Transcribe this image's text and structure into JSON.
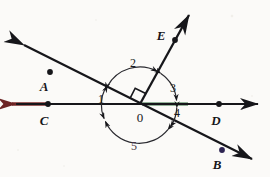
{
  "figure": {
    "type": "geometry-diagram",
    "background_color": "#fbfaf8",
    "ink_color": "#16161a",
    "vertex_label": "0",
    "points": [
      {
        "id": "A",
        "label": "A",
        "dot_x": 50,
        "dot_y": 72,
        "label_x": 44,
        "label_y": 86,
        "dot_color": "#16161a"
      },
      {
        "id": "E",
        "label": "E",
        "dot_x": 175,
        "dot_y": 40,
        "label_x": 161,
        "label_y": 35,
        "dot_color": "#16161a"
      },
      {
        "id": "C",
        "label": "C",
        "dot_x": 48,
        "dot_y": 104,
        "label_x": 44,
        "label_y": 120,
        "dot_color": "#16161a"
      },
      {
        "id": "D",
        "label": "D",
        "dot_x": 219,
        "dot_y": 104,
        "label_x": 216,
        "label_y": 120,
        "dot_color": "#16161a"
      },
      {
        "id": "B",
        "label": "B",
        "dot_x": 222,
        "dot_y": 150,
        "label_x": 217,
        "label_y": 164,
        "dot_color": "#2d2452"
      }
    ],
    "vertex": {
      "x": 140,
      "y": 104,
      "label_x": 140,
      "label_y": 117
    },
    "angles": [
      {
        "id": "1",
        "label": "1",
        "label_x": 101,
        "label_y": 99
      },
      {
        "id": "2",
        "label": "2",
        "label_x": 133,
        "label_y": 63
      },
      {
        "id": "3",
        "label": "3",
        "label_x": 173,
        "label_y": 88
      },
      {
        "id": "4",
        "label": "4",
        "label_x": 177,
        "label_y": 113
      },
      {
        "id": "5",
        "label": "5",
        "label_x": 134,
        "label_y": 146
      }
    ],
    "lines": [
      {
        "id": "AB",
        "name": "line-ab",
        "x1": 18,
        "y1": 42,
        "x2": 258,
        "y2": 162,
        "color": "#16161a",
        "arrow_start": true,
        "arrow_end": true
      },
      {
        "id": "CD",
        "name": "line-cd",
        "x1": 10,
        "y1": 104,
        "x2": 262,
        "y2": 104,
        "color": "#16161a",
        "arrow_start": true,
        "arrow_end": true
      },
      {
        "id": "OE",
        "name": "ray-oe",
        "x1": 140,
        "y1": 104,
        "x2": 193,
        "y2": 8,
        "color": "#16161a",
        "arrow_start": false,
        "arrow_end": true
      }
    ],
    "segment_tints": [
      {
        "id": "CD-left",
        "color": "#7a2b2b",
        "x1": 12,
        "y1": 104,
        "x2": 46,
        "y2": 104
      },
      {
        "id": "CD-right",
        "color": "#2f6b3a",
        "x1": 142,
        "y1": 104,
        "x2": 186,
        "y2": 104
      }
    ],
    "right_angle_marker": {
      "x": 140,
      "y": 104,
      "size": 11,
      "between": [
        "ray-oa",
        "ray-oe"
      ]
    },
    "arc_radius": 37
  }
}
